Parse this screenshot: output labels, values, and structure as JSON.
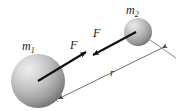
{
  "figure": {
    "background_color": "#ffffff"
  },
  "labels": {
    "mass1": "m",
    "mass1_subscript": "1",
    "mass2": "m",
    "mass2_subscript": "2",
    "force_left": "F",
    "force_right": "F",
    "distance": "r"
  },
  "colors": {
    "sphere_highlight": "#e2e2e2",
    "sphere_mid": "#b0b0b0",
    "sphere_edge": "#6e6e6e",
    "arrow": "#111111",
    "dimension_line": "#4a4a4a",
    "text": "#1a1a1a"
  },
  "geometry": {
    "mass1_center_x": 38,
    "mass1_center_y": 81,
    "mass1_radius": 27,
    "mass2_center_x": 138,
    "mass2_center_y": 32,
    "mass2_radius": 14,
    "separation_label_x": 112,
    "separation_label_y": 74
  }
}
